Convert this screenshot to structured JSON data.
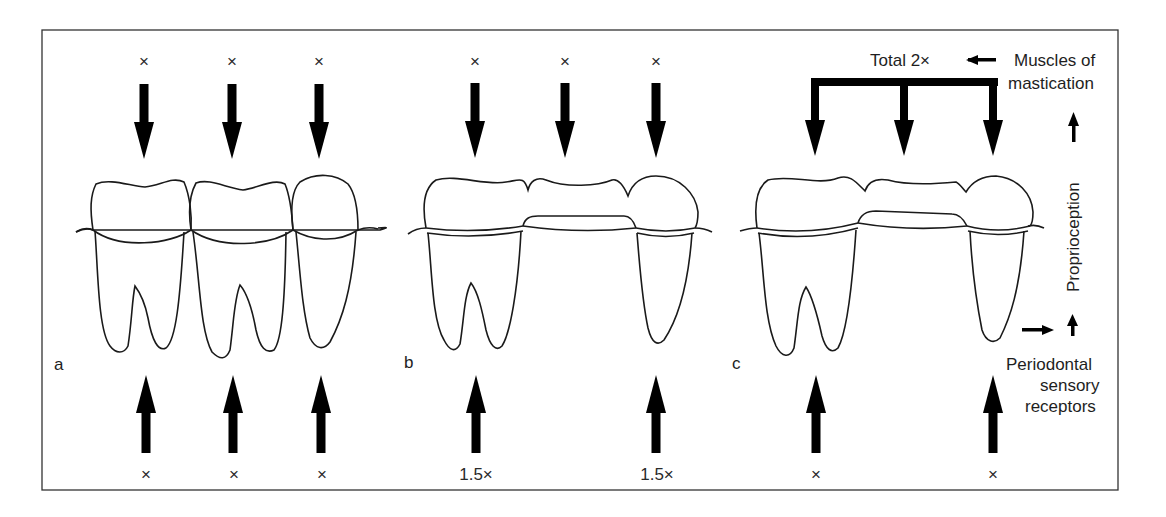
{
  "figure": {
    "panels": [
      {
        "label": "a",
        "top_forces": [
          "×",
          "×",
          "×"
        ],
        "bottom_forces": [
          "×",
          "×",
          "×"
        ],
        "teeth": [
          "molar",
          "molar",
          "premolar"
        ]
      },
      {
        "label": "b",
        "top_forces": [
          "×",
          "×",
          "×"
        ],
        "bottom_forces": [
          "1.5×",
          "1.5×"
        ],
        "teeth": [
          "molar-abutment",
          "pontic",
          "premolar-abutment"
        ]
      },
      {
        "label": "c",
        "top_label": "Total 2×",
        "bottom_forces": [
          "×",
          "×"
        ],
        "teeth": [
          "molar-abutment",
          "pontic",
          "premolar-abutment"
        ]
      }
    ],
    "annotations": {
      "muscles_line1": "Muscles of",
      "muscles_line2": "mastication",
      "proprioception": "Proprioception",
      "receptors_line1": "Periodontal",
      "receptors_line2": "sensory",
      "receptors_line3": "receptors"
    },
    "colors": {
      "line": "#1a1a1a",
      "arrow": "#000000",
      "background": "#ffffff"
    }
  }
}
